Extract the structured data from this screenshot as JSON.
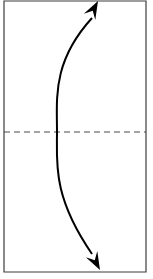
{
  "figure": {
    "type": "line-diagram",
    "title": "Curved double-headed arrow over bisected panel",
    "background_color": "#ffffff",
    "canvas": {
      "width": 153,
      "height": 279
    }
  },
  "panel": {
    "name": "bounding-panel",
    "x": 4,
    "y": 1,
    "width": 142,
    "height": 271,
    "fill_color": "#ffffff",
    "border_color": "#3c3c3c",
    "border_width": 1.2
  },
  "midline": {
    "name": "horizontal-dashed-midline",
    "orientation": "horizontal",
    "y": 132,
    "x_start": 4,
    "x_end": 146,
    "color": "#4a4a4a",
    "width": 1.2,
    "dash_pattern": "6 4",
    "style": "dashed"
  },
  "arrow": {
    "name": "curved-double-arrow",
    "color": "#000000",
    "stroke_width": 2.0,
    "bow_direction": "left",
    "heads": "both",
    "start_point": {
      "x": 92,
      "y": 258
    },
    "end_point": {
      "x": 92,
      "y": 14
    },
    "control_point_lower": {
      "x": 52,
      "y": 196
    },
    "control_point_upper": {
      "x": 52,
      "y": 62
    },
    "apex_point": {
      "x": 57,
      "y": 132
    },
    "head_top": {
      "name": "arrowhead-top",
      "tip_x": 98,
      "tip_y": 1,
      "angle_deg": -62,
      "length": 18,
      "half_width": 6.5
    },
    "head_bottom": {
      "name": "arrowhead-bottom",
      "tip_x": 100,
      "tip_y": 270,
      "angle_deg": 62,
      "length": 18,
      "half_width": 6.5
    }
  },
  "chart_data": {
    "type": "line",
    "title": "Curved double-headed arrow over bisected panel",
    "xlabel": "",
    "ylabel": "",
    "xlim": [
      0,
      153
    ],
    "ylim": [
      0,
      279
    ],
    "grid": false,
    "legend": null,
    "series": [
      {
        "name": "curved-arrow-path",
        "stroke": "#000000",
        "x": [
          92,
          80,
          70,
          63,
          59,
          57,
          57,
          59,
          63,
          70,
          80,
          92
        ],
        "y": [
          258,
          240,
          216,
          190,
          162,
          140,
          124,
          100,
          74,
          50,
          30,
          14
        ]
      },
      {
        "name": "dashed-midline",
        "stroke": "#4a4a4a",
        "x": [
          4,
          146
        ],
        "y": [
          132,
          132
        ]
      }
    ],
    "annotations": [
      {
        "name": "arrowhead-top",
        "x": 98,
        "y": 1,
        "marker": "triangle-up-right"
      },
      {
        "name": "arrowhead-bottom",
        "x": 100,
        "y": 270,
        "marker": "triangle-down-right"
      }
    ]
  }
}
